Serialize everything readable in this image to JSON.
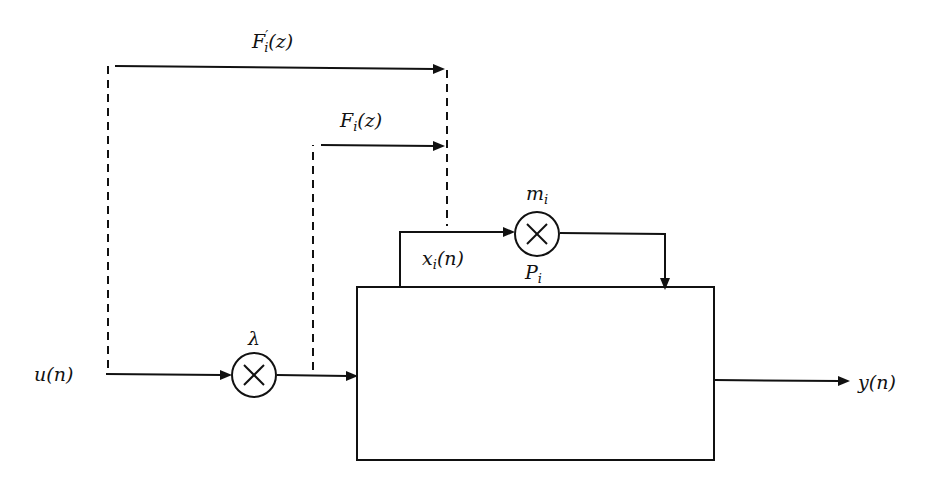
{
  "diagram": {
    "type": "block-diagram",
    "labels": {
      "input": "u(n)",
      "output": "y(n)",
      "lambda": "λ",
      "m_base": "m",
      "m_sub": "i",
      "x_base": "x",
      "x_sub": "i",
      "x_arg": "(n)",
      "P_base": "P",
      "P_sub": "i",
      "Fprime_base": "F",
      "Fprime_prime": "′",
      "Fprime_sub": "i",
      "Fprime_arg": "(z)",
      "F_base": "F",
      "F_sub": "i",
      "F_arg": "(z)"
    },
    "blocks": [
      {
        "id": "multiplier-lambda",
        "label": "λ",
        "shape": "circle-times"
      },
      {
        "id": "multiplier-m",
        "label": "m_i",
        "shape": "circle-times"
      },
      {
        "id": "plant-P",
        "label": "P_i",
        "shape": "rectangle"
      }
    ],
    "edges": [
      {
        "from": "u(n)",
        "to": "multiplier-lambda",
        "style": "solid"
      },
      {
        "from": "multiplier-lambda",
        "to": "plant-P",
        "style": "solid"
      },
      {
        "from": "plant-P",
        "to": "y(n)",
        "style": "solid"
      },
      {
        "from": "plant-P",
        "to": "multiplier-m",
        "label": "x_i(n)",
        "style": "solid"
      },
      {
        "from": "multiplier-m",
        "to": "plant-P",
        "style": "solid"
      },
      {
        "from": "u(n)",
        "to": "x_i(n)",
        "label": "F'_i(z)",
        "style": "dashed"
      },
      {
        "from": "lambda-output",
        "to": "x_i(n)",
        "label": "F_i(z)",
        "style": "dashed"
      }
    ]
  }
}
